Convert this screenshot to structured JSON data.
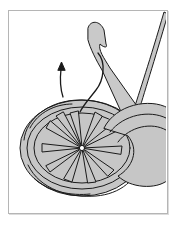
{
  "figure": {
    "colors": {
      "yarn_fill": "#c6c6c6",
      "hook_fill": "#c9c9c9",
      "outline": "#1a1a1a",
      "frame": "#b5b5b5",
      "background": "#ffffff"
    },
    "annotations": [
      {
        "type": "arrow",
        "direction": "up",
        "icon": "arrow-up-icon"
      }
    ]
  }
}
